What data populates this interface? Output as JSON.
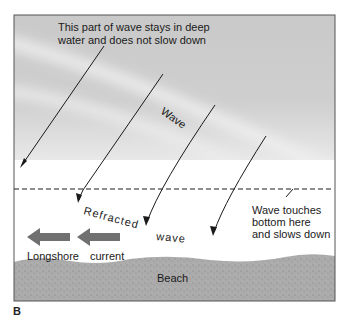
{
  "figure": {
    "panel_label": "B",
    "annotations": {
      "deep_water_line1": "This part of wave stays in deep",
      "deep_water_line2": "water and does not slow down",
      "wave": "Wave",
      "refracted": "Refracted",
      "refracted_wave": "wave",
      "touch_line1": "Wave touches",
      "touch_line2": "bottom here",
      "touch_line3": "and slows down",
      "longshore": "Longshore",
      "current": "current",
      "beach": "Beach"
    },
    "colors": {
      "water": "#c8c8c8",
      "wave_highlight": "#ececec",
      "beach": "#a9a9a9",
      "current_arrow": "#6e6e6e",
      "line": "#1a1a1a"
    }
  }
}
